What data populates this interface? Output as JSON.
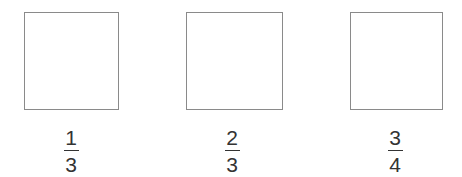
{
  "figure": {
    "background_color": "#ffffff",
    "shape_border_color": "#8a8a8a",
    "text_color": "#333333",
    "items": [
      {
        "shape": "square",
        "fraction": {
          "numerator": "1",
          "denominator": "3",
          "text": "1/3"
        }
      },
      {
        "shape": "square",
        "fraction": {
          "numerator": "2",
          "denominator": "3",
          "text": "2/3"
        }
      },
      {
        "shape": "square",
        "fraction": {
          "numerator": "3",
          "denominator": "4",
          "text": "3/4"
        }
      }
    ]
  }
}
